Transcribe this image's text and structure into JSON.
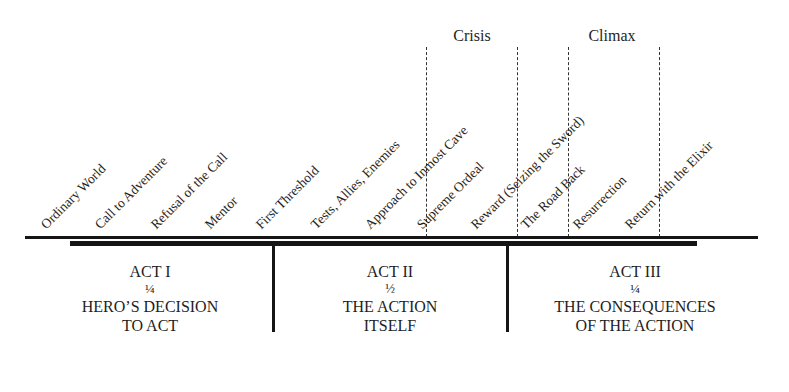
{
  "peaks": [
    {
      "label": "Crisis",
      "x": 472
    },
    {
      "label": "Climax",
      "x": 612
    }
  ],
  "dashed_lines_x": [
    426,
    517,
    568,
    659
  ],
  "stages": [
    {
      "label": "Ordinary World",
      "x": 48
    },
    {
      "label": "Call to Adventure",
      "x": 102
    },
    {
      "label": "Refusal of the Call",
      "x": 158
    },
    {
      "label": "Mentor",
      "x": 212
    },
    {
      "label": "First Threshold",
      "x": 263
    },
    {
      "label": "Tests, Allies, Enemies",
      "x": 318
    },
    {
      "label": "Approach to Inmost Cave",
      "x": 372
    },
    {
      "label": "Supreme Ordeal",
      "x": 424
    },
    {
      "label": "Reward (Seizing the Sword)",
      "x": 478
    },
    {
      "label": "The Road Back",
      "x": 528
    },
    {
      "label": "Resurrection",
      "x": 580
    },
    {
      "label": "Return with the Elixir",
      "x": 632
    }
  ],
  "acts": [
    {
      "name": "ACT I",
      "fraction": "¼",
      "line1": "HERO’S DECISION",
      "line2": "TO ACT",
      "x": 150
    },
    {
      "name": "ACT II",
      "fraction": "½",
      "line1": "THE ACTION",
      "line2": "ITSELF",
      "x": 390
    },
    {
      "name": "ACT III",
      "fraction": "¼",
      "line1": "THE CONSEQUENCES",
      "line2": "OF THE ACTION",
      "x": 635
    }
  ],
  "act_dividers_x": [
    273,
    507
  ]
}
